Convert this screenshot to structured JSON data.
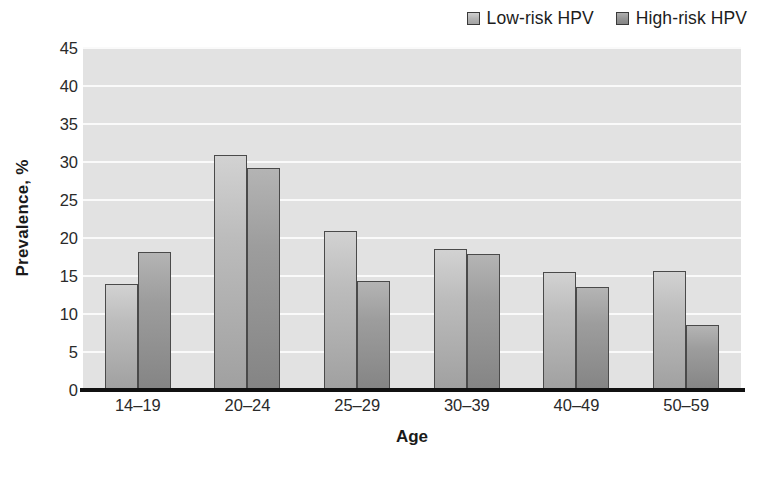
{
  "chart_data": {
    "type": "bar",
    "title": "",
    "xlabel": "Age",
    "ylabel": "Prevalence, %",
    "ylim": [
      0,
      45
    ],
    "yticks": [
      0,
      5,
      10,
      15,
      20,
      25,
      30,
      35,
      40,
      45
    ],
    "grid": true,
    "legend_position": "top-right",
    "categories": [
      "14–19",
      "20–24",
      "25–29",
      "30–39",
      "40–49",
      "50–59"
    ],
    "series": [
      {
        "name": "Low-risk HPV",
        "color": "#b4b4b4",
        "values": [
          14.0,
          30.9,
          20.9,
          18.6,
          15.5,
          15.6
        ]
      },
      {
        "name": "High-risk HPV",
        "color": "#969696",
        "values": [
          18.2,
          29.2,
          14.3,
          17.9,
          13.6,
          8.6
        ]
      }
    ]
  },
  "colors": {
    "plot_background": "#e2e2e2",
    "gridline": "#fafafa",
    "axis": "#111111",
    "bar_outline": "#4a4a4a"
  }
}
